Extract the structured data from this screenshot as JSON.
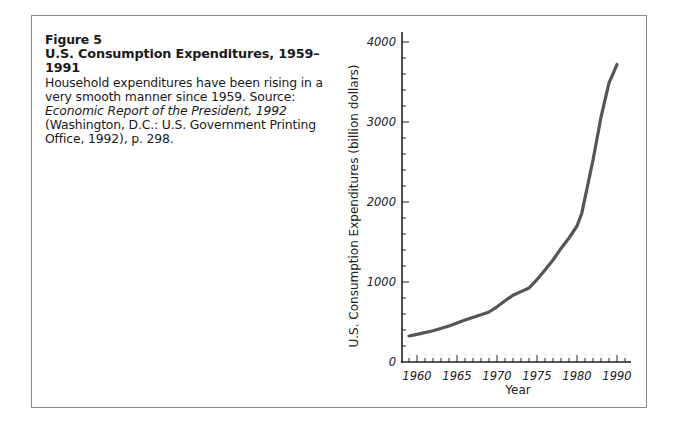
{
  "figure": {
    "number": "Figure 5",
    "title": "U.S. Consumption Expenditures, 1959–1991",
    "caption_plain_1": "Household expenditures have been rising in a very smooth manner since 1959. Source: ",
    "caption_italic_1": "Economic Report of the President, 1992",
    "caption_plain_2": " (Washington, D.C.: U.S. Government Printing Office, 1992), p. 298."
  },
  "colors": {
    "line": "#555555",
    "axis": "#222222",
    "frame": "#8a8a8a"
  },
  "chart_data": {
    "type": "line",
    "title": "U.S. Consumption Expenditures, 1959–1991",
    "xlabel": "Year",
    "ylabel": "U.S. Consumption Expenditures (billion dollars)",
    "x_tick_labels": [
      "1960",
      "1965",
      "1970",
      "1975",
      "1980",
      "1990"
    ],
    "x_tick_positions": [
      1960,
      1965,
      1970,
      1975,
      1980,
      1985
    ],
    "y_tick_labels": [
      "0",
      "1000",
      "2000",
      "3000",
      "4000"
    ],
    "y_ticks": [
      0,
      1000,
      2000,
      3000,
      4000
    ],
    "ylim": [
      0,
      4000
    ],
    "xlim": [
      1958,
      1987
    ],
    "grid": false,
    "legend": null,
    "note": "x positions follow the axis tick spacing; the final major tick is labeled 1990",
    "series": [
      {
        "name": "U.S. Consumption Expenditures",
        "x": [
          1959,
          1960,
          1962,
          1964,
          1966,
          1968,
          1969,
          1970,
          1971,
          1972,
          1973,
          1974,
          1975,
          1976,
          1977,
          1978,
          1979,
          1980,
          1980.6,
          1981.4,
          1982,
          1983,
          1984,
          1984.5,
          1985
        ],
        "values": [
          325,
          345,
          390,
          450,
          525,
          590,
          625,
          690,
          765,
          835,
          880,
          925,
          1030,
          1150,
          1275,
          1420,
          1550,
          1700,
          1860,
          2240,
          2525,
          3060,
          3490,
          3600,
          3720
        ]
      }
    ]
  }
}
